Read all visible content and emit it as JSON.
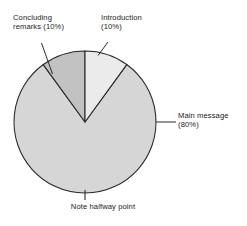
{
  "figure": {
    "background_color": "#ffffff",
    "outline_color": "#2b2b2b"
  },
  "labels": {
    "concluding": "Concluding\nremarks (10%)",
    "introduction": "Introduction\n(10%)",
    "main": "Main message\n(80%)",
    "halfway": "Note halfway point"
  },
  "chart_data": {
    "type": "pie",
    "title": "",
    "subtitle": "",
    "xlabel": "",
    "ylabel": "",
    "grid": false,
    "legend_position": "callouts",
    "start_angle_deg": 90,
    "direction": "counterclockwise",
    "center": {
      "cx": 85,
      "cy": 122
    },
    "radius": 71,
    "categories": [
      "Introduction",
      "Main message",
      "Concluding remarks"
    ],
    "values": [
      10,
      80,
      10
    ],
    "units": "percent",
    "slices": [
      {
        "name": "Introduction",
        "label": "Introduction (10%)",
        "value": 10,
        "percent": "10%",
        "color": "#ebebeb",
        "start_deg": 90,
        "end_deg": 126,
        "callout_anchor": "top-right"
      },
      {
        "name": "Main message",
        "label": "Main message (80%)",
        "value": 80,
        "percent": "80%",
        "color": "#d6d6d6",
        "start_deg": 126,
        "end_deg": 414,
        "callout_anchor": "right"
      },
      {
        "name": "Concluding remarks",
        "label": "Concluding remarks (10%)",
        "value": 10,
        "percent": "10%",
        "color": "#c2c2c2",
        "start_deg": 54,
        "end_deg": 90,
        "callout_anchor": "top-left"
      }
    ],
    "annotations": [
      {
        "name": "halfway-tick",
        "text": "Note halfway point",
        "position_deg": 270,
        "description": "tick mark at bottom of circle marking the halfway point"
      }
    ]
  }
}
